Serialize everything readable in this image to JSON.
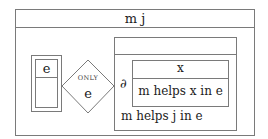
{
  "diagram": {
    "outer": {
      "title": "m j"
    },
    "left_entity": {
      "label": "e"
    },
    "relationship": {
      "qualifier": "ONLY",
      "label": "e"
    },
    "right_box": {
      "title": "",
      "partial_symbol": "∂",
      "inner": {
        "title": "x",
        "body": "m helps x in e"
      },
      "footer": "m helps j in e"
    },
    "colors": {
      "line": "#7a7a7a",
      "text": "#222222",
      "background": "#ffffff"
    }
  }
}
